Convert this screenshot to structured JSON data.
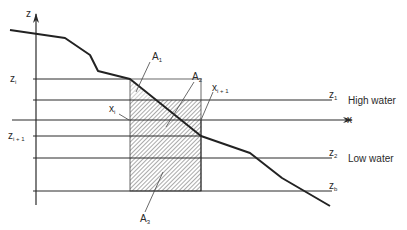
{
  "diagram": {
    "axes": {
      "z_label": "z",
      "x_label": "x"
    },
    "levels": {
      "zi": {
        "main": "z",
        "sub": "i"
      },
      "zi1": {
        "main": "z",
        "sub": "i + 1"
      },
      "z1": {
        "main": "z",
        "sub": "1",
        "description": "High water"
      },
      "z2": {
        "main": "z",
        "sub": "2",
        "description": "Low water"
      },
      "zb": {
        "main": "z",
        "sub": "b"
      }
    },
    "positions": {
      "xi": {
        "main": "x",
        "sub": "i"
      },
      "xi1": {
        "main": "x",
        "sub": "i + 1"
      }
    },
    "areas": {
      "A1": {
        "main": "A",
        "sub": "1"
      },
      "A2": {
        "main": "A",
        "sub": "2"
      },
      "A3": {
        "main": "A",
        "sub": "3"
      }
    },
    "colors": {
      "line": "#2a2a2a",
      "profile": "#222222",
      "hatch": "#555555",
      "background": "#ffffff"
    }
  }
}
